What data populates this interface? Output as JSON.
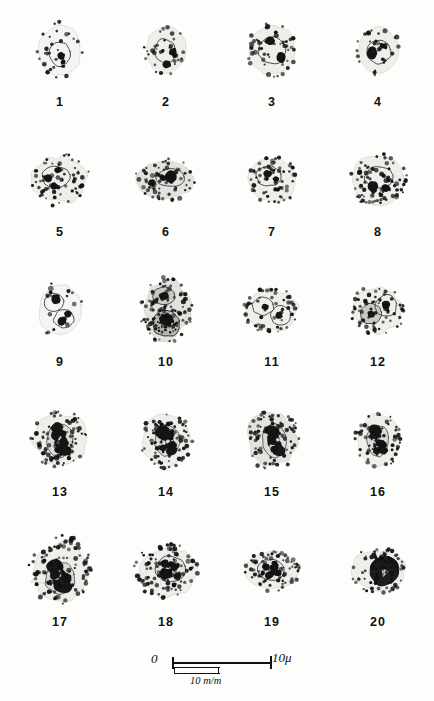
{
  "plate": {
    "background_color": "#fdfdfc",
    "ink_color": "#111111",
    "columns": 4,
    "rows": 5,
    "total_figures": 20
  },
  "figures": [
    {
      "number": "1",
      "row": 1,
      "col": 1,
      "shape": "round",
      "width": 46,
      "height": 56,
      "pallor": "very-pale",
      "granule_count": 30,
      "granule_size": 1.7,
      "nuclei": [
        {
          "cx": 0,
          "cy": 4,
          "rx": 11,
          "ry": 12,
          "tone": "outline"
        }
      ],
      "dark_blobs": [
        {
          "cx": 1,
          "cy": 6,
          "r": 4.0
        },
        {
          "cx": 3,
          "cy": 12,
          "r": 2.6
        }
      ],
      "seed": 101
    },
    {
      "number": "2",
      "row": 1,
      "col": 2,
      "shape": "round",
      "width": 44,
      "height": 52,
      "pallor": "pale",
      "granule_count": 36,
      "granule_size": 1.8,
      "nuclei": [
        {
          "cx": -1,
          "cy": 1,
          "rx": 11,
          "ry": 12,
          "tone": "outline"
        }
      ],
      "dark_blobs": [
        {
          "cx": 7,
          "cy": 2,
          "r": 4.2
        },
        {
          "cx": 1,
          "cy": 14,
          "r": 4.4
        }
      ],
      "seed": 202
    },
    {
      "number": "3",
      "row": 1,
      "col": 3,
      "shape": "round",
      "width": 50,
      "height": 54,
      "pallor": "pale",
      "granule_count": 46,
      "granule_size": 1.9,
      "nuclei": [
        {
          "cx": 0,
          "cy": 0,
          "rx": 14,
          "ry": 14,
          "tone": "outline"
        }
      ],
      "dark_blobs": [
        {
          "cx": -2,
          "cy": -9,
          "r": 5.0
        },
        {
          "cx": 9,
          "cy": 7,
          "r": 5.2
        }
      ],
      "seed": 303
    },
    {
      "number": "4",
      "row": 1,
      "col": 4,
      "shape": "round",
      "width": 44,
      "height": 50,
      "pallor": "pale",
      "granule_count": 34,
      "granule_size": 1.8,
      "nuclei": [
        {
          "cx": 1,
          "cy": 2,
          "rx": 12,
          "ry": 12,
          "tone": "outline"
        }
      ],
      "dark_blobs": [
        {
          "cx": -6,
          "cy": 3,
          "r": 5.4
        },
        {
          "cx": 5,
          "cy": -4,
          "r": 3.0
        }
      ],
      "seed": 404
    },
    {
      "number": "5",
      "row": 2,
      "col": 1,
      "shape": "irregular",
      "width": 60,
      "height": 52,
      "pallor": "pale",
      "granule_count": 66,
      "granule_size": 1.7,
      "nuclei": [
        {
          "cx": -4,
          "cy": -3,
          "rx": 14,
          "ry": 11,
          "tone": "outline"
        }
      ],
      "dark_blobs": [
        {
          "cx": -12,
          "cy": -2,
          "r": 4.6
        },
        {
          "cx": -2,
          "cy": -10,
          "r": 3.4
        },
        {
          "cx": -6,
          "cy": 6,
          "r": 3.6
        }
      ],
      "seed": 505
    },
    {
      "number": "6",
      "row": 2,
      "col": 2,
      "shape": "oval-wide",
      "width": 62,
      "height": 42,
      "pallor": "grey",
      "granule_count": 60,
      "granule_size": 1.8,
      "nuclei": [
        {
          "cx": 4,
          "cy": -2,
          "rx": 15,
          "ry": 9,
          "tone": "outline"
        }
      ],
      "dark_blobs": [
        {
          "cx": -14,
          "cy": 3,
          "r": 4.0
        },
        {
          "cx": -3,
          "cy": -2,
          "r": 3.6
        },
        {
          "cx": 5,
          "cy": -3,
          "r": 5.6
        }
      ],
      "seed": 606
    },
    {
      "number": "7",
      "row": 2,
      "col": 3,
      "shape": "round",
      "width": 52,
      "height": 48,
      "pallor": "pale",
      "granule_count": 62,
      "granule_size": 1.7,
      "nuclei": [
        {
          "cx": -3,
          "cy": -4,
          "rx": 13,
          "ry": 10,
          "tone": "outline"
        }
      ],
      "dark_blobs": [
        {
          "cx": -4,
          "cy": -6,
          "r": 4.4
        },
        {
          "cx": 4,
          "cy": -1,
          "r": 3.2
        }
      ],
      "seed": 707
    },
    {
      "number": "8",
      "row": 2,
      "col": 4,
      "shape": "round",
      "width": 58,
      "height": 54,
      "pallor": "pale",
      "granule_count": 78,
      "granule_size": 1.8,
      "nuclei": [
        {
          "cx": 1,
          "cy": -3,
          "rx": 14,
          "ry": 11,
          "tone": "outline"
        }
      ],
      "dark_blobs": [
        {
          "cx": -5,
          "cy": 7,
          "r": 5.0
        },
        {
          "cx": 8,
          "cy": 8,
          "r": 4.6
        }
      ],
      "seed": 808
    },
    {
      "number": "9",
      "row": 3,
      "col": 1,
      "shape": "round",
      "width": 46,
      "height": 56,
      "pallor": "very-pale",
      "granule_count": 16,
      "granule_size": 2.0,
      "nuclei": [
        {
          "cx": -6,
          "cy": -8,
          "rx": 10,
          "ry": 9,
          "tone": "outline"
        },
        {
          "cx": 4,
          "cy": 9,
          "rx": 10,
          "ry": 9,
          "tone": "outline"
        }
      ],
      "dark_blobs": [
        {
          "cx": -4,
          "cy": -11,
          "r": 4.6
        },
        {
          "cx": 8,
          "cy": 4,
          "r": 4.0
        },
        {
          "cx": 2,
          "cy": 11,
          "r": 4.4
        }
      ],
      "seed": 909
    },
    {
      "number": "10",
      "row": 3,
      "col": 2,
      "shape": "irregular",
      "width": 52,
      "height": 66,
      "pallor": "grey",
      "granule_count": 96,
      "granule_size": 1.8,
      "nuclei": [
        {
          "cx": -2,
          "cy": -14,
          "rx": 11,
          "ry": 9,
          "tone": "mid"
        },
        {
          "cx": 0,
          "cy": 14,
          "rx": 14,
          "ry": 13,
          "tone": "dark"
        }
      ],
      "dark_blobs": [
        {
          "cx": -2,
          "cy": -14,
          "r": 5.0
        },
        {
          "cx": 0,
          "cy": 10,
          "r": 7.0
        }
      ],
      "seed": 1010
    },
    {
      "number": "11",
      "row": 3,
      "col": 3,
      "shape": "irregular",
      "width": 56,
      "height": 46,
      "pallor": "pale",
      "granule_count": 54,
      "granule_size": 1.7,
      "nuclei": [
        {
          "cx": -9,
          "cy": -4,
          "rx": 11,
          "ry": 9,
          "tone": "outline"
        },
        {
          "cx": 9,
          "cy": 6,
          "rx": 10,
          "ry": 10,
          "tone": "outline"
        }
      ],
      "dark_blobs": [
        {
          "cx": -7,
          "cy": -3,
          "r": 3.4
        },
        {
          "cx": 7,
          "cy": 5,
          "r": 3.8
        }
      ],
      "seed": 1111
    },
    {
      "number": "12",
      "row": 3,
      "col": 4,
      "shape": "irregular",
      "width": 54,
      "height": 50,
      "pallor": "pale",
      "granule_count": 64,
      "granule_size": 1.7,
      "nuclei": [
        {
          "cx": -7,
          "cy": 4,
          "rx": 11,
          "ry": 10,
          "tone": "mid"
        },
        {
          "cx": 8,
          "cy": -4,
          "rx": 11,
          "ry": 11,
          "tone": "outline"
        }
      ],
      "dark_blobs": [
        {
          "cx": -7,
          "cy": 4,
          "r": 3.8
        },
        {
          "cx": 8,
          "cy": -5,
          "r": 4.2
        }
      ],
      "seed": 1212
    },
    {
      "number": "13",
      "row": 4,
      "col": 1,
      "shape": "irregular",
      "width": 58,
      "height": 58,
      "pallor": "pale",
      "granule_count": 88,
      "granule_size": 1.7,
      "nuclei": [
        {
          "cx": 0,
          "cy": 0,
          "rx": 13,
          "ry": 17,
          "tone": "lobed"
        }
      ],
      "dark_blobs": [
        {
          "cx": -4,
          "cy": -5,
          "r": 4.6
        },
        {
          "cx": 4,
          "cy": 2,
          "r": 4.4
        },
        {
          "cx": -2,
          "cy": 10,
          "r": 4.0
        }
      ],
      "seed": 1313
    },
    {
      "number": "14",
      "row": 4,
      "col": 2,
      "shape": "round",
      "width": 52,
      "height": 56,
      "pallor": "pale",
      "granule_count": 76,
      "granule_size": 1.7,
      "nuclei": [
        {
          "cx": 1,
          "cy": 1,
          "rx": 13,
          "ry": 15,
          "tone": "lobed"
        }
      ],
      "dark_blobs": [
        {
          "cx": -1,
          "cy": -4,
          "r": 4.4
        },
        {
          "cx": 6,
          "cy": 6,
          "r": 4.8
        },
        {
          "cx": -3,
          "cy": 8,
          "r": 3.6
        }
      ],
      "seed": 1414
    },
    {
      "number": "15",
      "row": 4,
      "col": 3,
      "shape": "irregular",
      "width": 56,
      "height": 60,
      "pallor": "grey",
      "granule_count": 84,
      "granule_size": 1.7,
      "nuclei": [
        {
          "cx": 2,
          "cy": 0,
          "rx": 12,
          "ry": 17,
          "tone": "lobed"
        }
      ],
      "dark_blobs": [
        {
          "cx": 3,
          "cy": -9,
          "r": 4.2
        },
        {
          "cx": 0,
          "cy": 0,
          "r": 4.6
        },
        {
          "cx": 2,
          "cy": 9,
          "r": 4.4
        }
      ],
      "seed": 1515
    },
    {
      "number": "16",
      "row": 4,
      "col": 4,
      "shape": "round",
      "width": 46,
      "height": 56,
      "pallor": "pale",
      "granule_count": 62,
      "granule_size": 1.7,
      "nuclei": [
        {
          "cx": 0,
          "cy": 1,
          "rx": 11,
          "ry": 16,
          "tone": "lobed"
        }
      ],
      "dark_blobs": [
        {
          "cx": 0,
          "cy": -8,
          "r": 4.0
        },
        {
          "cx": 2,
          "cy": 3,
          "r": 4.4
        },
        {
          "cx": -1,
          "cy": 11,
          "r": 4.0
        }
      ],
      "seed": 1616
    },
    {
      "number": "17",
      "row": 5,
      "col": 1,
      "shape": "teardrop",
      "width": 62,
      "height": 70,
      "pallor": "pale",
      "granule_count": 104,
      "granule_size": 1.8,
      "nuclei": [
        {
          "cx": 0,
          "cy": 8,
          "rx": 15,
          "ry": 16,
          "tone": "lobed"
        }
      ],
      "dark_blobs": [
        {
          "cx": -5,
          "cy": 4,
          "r": 5.0
        },
        {
          "cx": 6,
          "cy": 8,
          "r": 5.4
        },
        {
          "cx": -2,
          "cy": 16,
          "r": 5.0
        },
        {
          "cx": 8,
          "cy": 17,
          "r": 4.2
        }
      ],
      "seed": 1717
    },
    {
      "number": "18",
      "row": 5,
      "col": 2,
      "shape": "teardrop",
      "width": 64,
      "height": 56,
      "pallor": "pale",
      "granule_count": 92,
      "granule_size": 1.8,
      "nuclei": [
        {
          "cx": 4,
          "cy": -1,
          "rx": 15,
          "ry": 13,
          "tone": "spotted"
        }
      ],
      "dark_blobs": [
        {
          "cx": -1,
          "cy": -6,
          "r": 4.4
        },
        {
          "cx": 8,
          "cy": -3,
          "r": 4.0
        },
        {
          "cx": 2,
          "cy": 4,
          "r": 4.6
        },
        {
          "cx": 11,
          "cy": 6,
          "r": 4.0
        }
      ],
      "seed": 1818
    },
    {
      "number": "19",
      "row": 5,
      "col": 3,
      "shape": "oval-wide",
      "width": 56,
      "height": 42,
      "pallor": "pale",
      "granule_count": 70,
      "granule_size": 1.7,
      "nuclei": [
        {
          "cx": -1,
          "cy": 0,
          "rx": 13,
          "ry": 11,
          "tone": "spotted"
        }
      ],
      "dark_blobs": [
        {
          "cx": -6,
          "cy": -3,
          "r": 4.0
        },
        {
          "cx": 2,
          "cy": -2,
          "r": 4.2
        },
        {
          "cx": -2,
          "cy": 5,
          "r": 3.8
        },
        {
          "cx": 6,
          "cy": 3,
          "r": 3.4
        }
      ],
      "seed": 1919
    },
    {
      "number": "20",
      "row": 5,
      "col": 4,
      "shape": "oval-wide",
      "width": 58,
      "height": 46,
      "pallor": "pale",
      "granule_count": 72,
      "granule_size": 1.7,
      "nuclei": [
        {
          "cx": 6,
          "cy": 1,
          "rx": 15,
          "ry": 15,
          "tone": "solid-dark"
        }
      ],
      "dark_blobs": [],
      "seed": 2020
    }
  ],
  "scale_bar": {
    "left_label": "0",
    "right_label": "10μ",
    "sub_label": "10 m/m"
  }
}
